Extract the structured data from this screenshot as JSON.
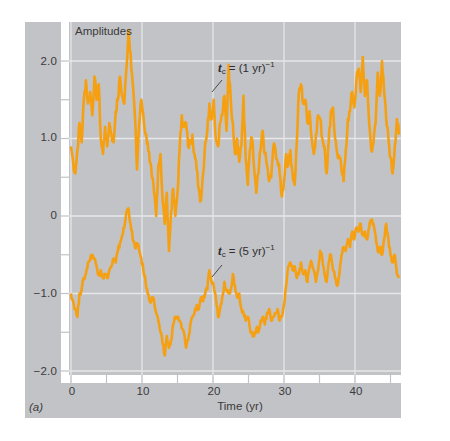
{
  "figure": {
    "panel_tag": "(a)",
    "title": "Amplitudes",
    "xlabel": "Time (yr)",
    "annotations": [
      {
        "symbol": "t",
        "subscript": "c",
        "equals": "= (1 yr)",
        "superscript": "−1"
      },
      {
        "symbol": "t",
        "subscript": "c",
        "equals": "= (5 yr)",
        "superscript": "−1"
      }
    ],
    "y_ticks": [
      "2.0",
      "1.0",
      "0",
      "−1.0",
      "−2.0"
    ],
    "x_ticks": [
      "0",
      "10",
      "20",
      "30",
      "40"
    ],
    "colors": {
      "line": "#f5a012",
      "panel": "#c2c3c6",
      "grid": "#e6e7e9",
      "gutter": "#ffffff",
      "text": "#3a3a3c"
    }
  },
  "chart_data": {
    "type": "line",
    "title": "Amplitudes",
    "xlabel": "Time (yr)",
    "ylabel": "Amplitudes",
    "panel_label": "(a)",
    "xlim": [
      0,
      46.4
    ],
    "ylim": [
      -2.0,
      2.5
    ],
    "x_ticks": [
      0,
      10,
      20,
      30,
      40
    ],
    "x_minor_ticks": [
      5,
      15,
      25,
      35,
      45
    ],
    "y_ticks": [
      2.0,
      1.0,
      0,
      -1.0,
      -2.0
    ],
    "y_minor_ticks": [
      1.5,
      0.5,
      -0.5,
      -1.5
    ],
    "grid": true,
    "legend": null,
    "series": [
      {
        "name": "t_c = (1 yr)^-1",
        "color": "#f5a012",
        "x": [
          0,
          0.3,
          0.6,
          0.9,
          1.2,
          1.5,
          1.8,
          2.1,
          2.4,
          2.7,
          3.0,
          3.3,
          3.6,
          3.9,
          4.2,
          4.5,
          4.8,
          5.1,
          5.4,
          5.7,
          6.0,
          6.3,
          6.6,
          6.9,
          7.2,
          7.5,
          7.8,
          8.1,
          8.4,
          8.7,
          9.0,
          9.3,
          9.6,
          9.9,
          10.2,
          10.5,
          10.8,
          11.1,
          11.4,
          11.7,
          12.0,
          12.3,
          12.6,
          12.9,
          13.2,
          13.5,
          13.8,
          14.1,
          14.4,
          14.7,
          15.0,
          15.3,
          15.6,
          15.9,
          16.2,
          16.5,
          16.8,
          17.1,
          17.4,
          17.7,
          18.0,
          18.3,
          18.6,
          18.9,
          19.2,
          19.5,
          19.8,
          20.1,
          20.4,
          20.7,
          21.0,
          21.3,
          21.6,
          21.9,
          22.2,
          22.5,
          22.8,
          23.1,
          23.4,
          23.7,
          24.0,
          24.3,
          24.6,
          24.9,
          25.2,
          25.5,
          25.8,
          26.1,
          26.4,
          26.7,
          27.0,
          27.3,
          27.6,
          27.9,
          28.2,
          28.5,
          28.8,
          29.1,
          29.4,
          29.7,
          30.0,
          30.3,
          30.6,
          30.9,
          31.2,
          31.5,
          31.8,
          32.1,
          32.4,
          32.7,
          33.0,
          33.3,
          33.6,
          33.9,
          34.2,
          34.5,
          34.8,
          35.1,
          35.4,
          35.7,
          36.0,
          36.3,
          36.6,
          36.9,
          37.2,
          37.5,
          37.8,
          38.1,
          38.4,
          38.7,
          39.0,
          39.3,
          39.6,
          39.9,
          40.2,
          40.5,
          40.8,
          41.1,
          41.4,
          41.7,
          42.0,
          42.3,
          42.6,
          42.9,
          43.2,
          43.5,
          43.8,
          44.1,
          44.4,
          44.7,
          45.0,
          45.3,
          45.6,
          45.9,
          46.2
        ],
        "y": [
          0.9,
          0.7,
          0.55,
          0.85,
          1.2,
          0.95,
          1.5,
          1.75,
          1.45,
          1.6,
          1.3,
          1.8,
          1.5,
          1.7,
          1.0,
          0.8,
          1.15,
          0.9,
          1.2,
          1.05,
          0.95,
          1.35,
          1.5,
          1.8,
          1.55,
          1.45,
          1.9,
          2.4,
          2.1,
          1.7,
          1.3,
          0.6,
          1.2,
          1.5,
          1.3,
          1.05,
          0.95,
          0.7,
          0.5,
          0.3,
          0.0,
          0.65,
          0.8,
          0.2,
          -0.1,
          0.3,
          -0.45,
          0.05,
          0.35,
          0.0,
          0.3,
          0.85,
          1.3,
          1.15,
          1.2,
          0.9,
          0.95,
          1.05,
          0.8,
          0.6,
          0.35,
          0.2,
          0.55,
          0.95,
          1.1,
          1.45,
          1.25,
          1.5,
          1.0,
          0.9,
          1.2,
          1.3,
          1.55,
          1.1,
          1.95,
          1.5,
          1.2,
          0.8,
          1.0,
          0.7,
          0.9,
          1.55,
          0.75,
          0.4,
          0.85,
          1.0,
          0.6,
          0.3,
          0.55,
          0.85,
          1.1,
          0.8,
          0.65,
          0.45,
          0.5,
          0.9,
          0.85,
          0.7,
          0.55,
          0.25,
          0.45,
          0.8,
          0.65,
          0.85,
          0.55,
          0.4,
          0.95,
          1.6,
          1.7,
          1.45,
          1.5,
          1.2,
          1.35,
          1.0,
          0.8,
          1.05,
          1.3,
          1.25,
          1.0,
          0.9,
          0.55,
          0.95,
          1.35,
          1.4,
          1.0,
          0.8,
          0.75,
          0.6,
          0.45,
          0.85,
          1.25,
          1.35,
          1.6,
          1.4,
          1.75,
          1.9,
          1.6,
          2.05,
          1.55,
          1.75,
          1.2,
          0.85,
          0.95,
          1.2,
          1.85,
          1.55,
          2.0,
          1.6,
          1.25,
          1.0,
          0.75,
          0.55,
          0.9,
          1.25,
          1.05
        ],
        "annotation_at": [
          19.6,
          1.55
        ]
      },
      {
        "name": "t_c = (5 yr)^-1",
        "color": "#f5a012",
        "x": [
          0,
          0.3,
          0.6,
          0.9,
          1.2,
          1.5,
          1.8,
          2.1,
          2.4,
          2.7,
          3.0,
          3.3,
          3.6,
          3.9,
          4.2,
          4.5,
          4.8,
          5.1,
          5.4,
          5.7,
          6.0,
          6.3,
          6.6,
          6.9,
          7.2,
          7.5,
          7.8,
          8.1,
          8.4,
          8.7,
          9.0,
          9.3,
          9.6,
          9.9,
          10.2,
          10.5,
          10.8,
          11.1,
          11.4,
          11.7,
          12.0,
          12.3,
          12.6,
          12.9,
          13.2,
          13.5,
          13.8,
          14.1,
          14.4,
          14.7,
          15.0,
          15.3,
          15.6,
          15.9,
          16.2,
          16.5,
          16.8,
          17.1,
          17.4,
          17.7,
          18.0,
          18.3,
          18.6,
          18.9,
          19.2,
          19.5,
          19.8,
          20.1,
          20.4,
          20.7,
          21.0,
          21.3,
          21.6,
          21.9,
          22.2,
          22.5,
          22.8,
          23.1,
          23.4,
          23.7,
          24.0,
          24.3,
          24.6,
          24.9,
          25.2,
          25.5,
          25.8,
          26.1,
          26.4,
          26.7,
          27.0,
          27.3,
          27.6,
          27.9,
          28.2,
          28.5,
          28.8,
          29.1,
          29.4,
          29.7,
          30.0,
          30.3,
          30.6,
          30.9,
          31.2,
          31.5,
          31.8,
          32.1,
          32.4,
          32.7,
          33.0,
          33.3,
          33.6,
          33.9,
          34.2,
          34.5,
          34.8,
          35.1,
          35.4,
          35.7,
          36.0,
          36.3,
          36.6,
          36.9,
          37.2,
          37.5,
          37.8,
          38.1,
          38.4,
          38.7,
          39.0,
          39.3,
          39.6,
          39.9,
          40.2,
          40.5,
          40.8,
          41.1,
          41.4,
          41.7,
          42.0,
          42.3,
          42.6,
          42.9,
          43.2,
          43.5,
          43.8,
          44.1,
          44.4,
          44.7,
          45.0,
          45.3,
          45.6,
          45.9,
          46.2
        ],
        "y": [
          -1.0,
          -1.1,
          -1.2,
          -1.3,
          -1.0,
          -0.95,
          -0.8,
          -0.75,
          -0.6,
          -0.55,
          -0.5,
          -0.55,
          -0.65,
          -0.75,
          -0.7,
          -0.8,
          -0.75,
          -0.8,
          -0.7,
          -0.65,
          -0.55,
          -0.6,
          -0.45,
          -0.35,
          -0.25,
          -0.15,
          0.05,
          0.1,
          -0.1,
          -0.3,
          -0.4,
          -0.35,
          -0.45,
          -0.55,
          -0.7,
          -0.85,
          -1.0,
          -1.1,
          -1.05,
          -1.1,
          -1.25,
          -1.35,
          -1.5,
          -1.65,
          -1.8,
          -1.55,
          -1.7,
          -1.6,
          -1.4,
          -1.3,
          -1.3,
          -1.35,
          -1.45,
          -1.5,
          -1.7,
          -1.6,
          -1.4,
          -1.3,
          -1.25,
          -1.15,
          -1.2,
          -1.05,
          -1.1,
          -1.0,
          -0.95,
          -0.7,
          -0.85,
          -0.9,
          -1.05,
          -1.3,
          -1.2,
          -1.05,
          -0.85,
          -0.95,
          -1.0,
          -0.95,
          -0.75,
          -0.9,
          -1.05,
          -1.0,
          -1.2,
          -1.25,
          -1.35,
          -1.3,
          -1.45,
          -1.5,
          -1.55,
          -1.45,
          -1.5,
          -1.35,
          -1.3,
          -1.4,
          -1.25,
          -1.2,
          -1.35,
          -1.3,
          -1.25,
          -1.2,
          -1.35,
          -1.3,
          -1.15,
          -0.9,
          -0.65,
          -0.6,
          -0.7,
          -0.65,
          -0.8,
          -0.75,
          -0.6,
          -0.75,
          -0.7,
          -0.85,
          -0.65,
          -0.6,
          -0.7,
          -0.85,
          -0.7,
          -0.45,
          -0.55,
          -0.75,
          -0.85,
          -0.6,
          -0.5,
          -0.7,
          -0.8,
          -0.9,
          -0.75,
          -0.5,
          -0.4,
          -0.45,
          -0.3,
          -0.4,
          -0.2,
          -0.3,
          -0.15,
          -0.2,
          -0.1,
          -0.25,
          -0.2,
          -0.3,
          -0.15,
          -0.05,
          -0.1,
          -0.25,
          -0.45,
          -0.4,
          -0.5,
          -0.3,
          -0.1,
          -0.3,
          -0.5,
          -0.6,
          -0.5,
          -0.75,
          -0.8
        ],
        "annotation_at": [
          19.6,
          -0.7
        ]
      }
    ]
  }
}
